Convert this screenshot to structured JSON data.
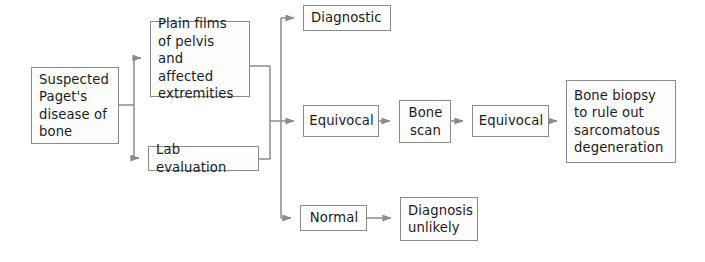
{
  "diagram": {
    "type": "flowchart",
    "orientation": "left-to-right",
    "background_color": "#ffffff",
    "box_fill_color": "#fdfdfd",
    "box_border_color": "#8a8a8a",
    "connector_color": "#8a8a8a",
    "text_color": "#1b1b1b",
    "nodes": [
      {
        "id": "suspected",
        "label": "Suspected\nPaget's\ndisease of\nbone",
        "x": 31,
        "y": 67,
        "w": 88,
        "h": 77,
        "align": "left"
      },
      {
        "id": "plain-films",
        "label": "Plain films\nof pelvis and\naffected\nextremities",
        "x": 150,
        "y": 21,
        "w": 100,
        "h": 76,
        "align": "left"
      },
      {
        "id": "lab-evaluation",
        "label": "Lab evaluation",
        "x": 148,
        "y": 146,
        "w": 111,
        "h": 25,
        "align": "left"
      },
      {
        "id": "diagnostic",
        "label": "Diagnostic",
        "x": 303,
        "y": 5,
        "w": 88,
        "h": 26,
        "align": "left"
      },
      {
        "id": "equivocal-1",
        "label": "Equivocal",
        "x": 303,
        "y": 105,
        "w": 76,
        "h": 32,
        "align": "center"
      },
      {
        "id": "bone-scan",
        "label": "Bone\nscan",
        "x": 399,
        "y": 100,
        "w": 52,
        "h": 43,
        "align": "center"
      },
      {
        "id": "equivocal-2",
        "label": "Equivocal",
        "x": 472,
        "y": 105,
        "w": 77,
        "h": 32,
        "align": "center"
      },
      {
        "id": "bone-biopsy",
        "label": "Bone biopsy\nto rule out\nsarcomatous\ndegeneration",
        "x": 566,
        "y": 80,
        "w": 110,
        "h": 83,
        "align": "left"
      },
      {
        "id": "normal",
        "label": "Normal",
        "x": 300,
        "y": 205,
        "w": 67,
        "h": 26,
        "align": "center"
      },
      {
        "id": "diagnosis-unlikely",
        "label": "Diagnosis\nunlikely",
        "x": 400,
        "y": 197,
        "w": 78,
        "h": 44,
        "align": "left"
      }
    ],
    "edges": [
      {
        "id": "suspected-to-plain-films",
        "from": "suspected",
        "to": "plain-films",
        "style": "elbow-split-up"
      },
      {
        "id": "suspected-to-lab-evaluation",
        "from": "suspected",
        "to": "lab-evaluation",
        "style": "elbow-split-down"
      },
      {
        "id": "plain-films-to-trunk",
        "from": "plain-films",
        "to": "merge-trunk",
        "style": "elbow-merge"
      },
      {
        "id": "lab-evaluation-to-trunk",
        "from": "lab-evaluation",
        "to": "merge-trunk",
        "style": "elbow-merge"
      },
      {
        "id": "trunk-to-diagnostic",
        "from": "merge-trunk",
        "to": "diagnostic",
        "style": "elbow-branch-up"
      },
      {
        "id": "trunk-to-equivocal-1",
        "from": "merge-trunk",
        "to": "equivocal-1",
        "style": "straight"
      },
      {
        "id": "trunk-to-normal",
        "from": "merge-trunk",
        "to": "normal",
        "style": "elbow-branch-down"
      },
      {
        "id": "equivocal-1-to-bone-scan",
        "from": "equivocal-1",
        "to": "bone-scan",
        "style": "straight"
      },
      {
        "id": "bone-scan-to-equivocal-2",
        "from": "bone-scan",
        "to": "equivocal-2",
        "style": "straight"
      },
      {
        "id": "equivocal-2-to-bone-biopsy",
        "from": "equivocal-2",
        "to": "bone-biopsy",
        "style": "straight"
      },
      {
        "id": "normal-to-diagnosis-unlikely",
        "from": "normal",
        "to": "diagnosis-unlikely",
        "style": "straight"
      }
    ]
  }
}
